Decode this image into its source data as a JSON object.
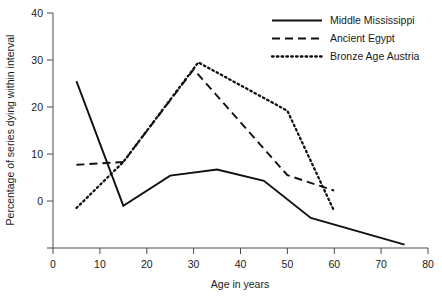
{
  "chart_data": {
    "type": "line",
    "title": "",
    "xlabel": "Age in years",
    "ylabel": "Percentage of series dying within interval",
    "xlim": [
      0,
      80
    ],
    "ylim": [
      0,
      50
    ],
    "xticks": [
      0,
      10,
      20,
      30,
      40,
      50,
      60,
      70,
      80
    ],
    "yticks": [
      0,
      10,
      20,
      30,
      40,
      50
    ],
    "grid": false,
    "legend_position": "top-right",
    "series": [
      {
        "name": "Middle Mississippi",
        "style": "solid",
        "x": [
          5,
          15,
          25,
          35,
          45,
          55,
          75
        ],
        "values": [
          35.5,
          9.0,
          15.4,
          16.7,
          14.3,
          6.4,
          0.7
        ]
      },
      {
        "name": "Ancient Egypt",
        "style": "dashed",
        "x": [
          5,
          15,
          30,
          50,
          60
        ],
        "values": [
          17.7,
          18.3,
          38.0,
          15.5,
          12.2
        ]
      },
      {
        "name": "Bronze Age Austria",
        "style": "dotted",
        "x": [
          5,
          15,
          31,
          50,
          60
        ],
        "values": [
          8.5,
          18.3,
          39.5,
          29.2,
          7.8
        ]
      }
    ]
  },
  "axes": {
    "x_tick_labels": [
      "0",
      "10",
      "20",
      "30",
      "40",
      "50",
      "60",
      "70",
      "80"
    ],
    "y_tick_labels": [
      "0",
      "10",
      "20",
      "30",
      "40",
      "50"
    ],
    "x_title": "Age in years",
    "y_title": "Percentage of series dying within interval"
  },
  "legend": {
    "items": [
      {
        "label": "Middle Mississippi",
        "style": "solid"
      },
      {
        "label": "Ancient Egypt",
        "style": "dashed"
      },
      {
        "label": "Bronze Age Austria",
        "style": "dotted"
      }
    ]
  },
  "colors": {
    "line": "#111111",
    "axis": "#4a4a4a",
    "text": "#1a1a1a",
    "background": "#ffffff"
  }
}
